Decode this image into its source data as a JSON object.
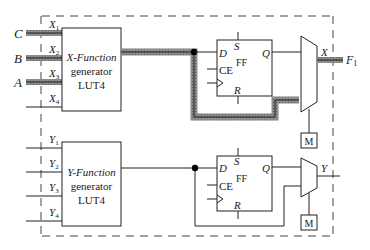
{
  "diagram": {
    "top_block": {
      "lut_label_line1": "X-Function",
      "lut_label_line2": "generator",
      "lut_label_line3": "LUT4",
      "inputs": [
        {
          "external": "C",
          "pin": "X",
          "sub": "1",
          "highlighted": true
        },
        {
          "external": "B",
          "pin": "X",
          "sub": "2",
          "highlighted": true
        },
        {
          "external": "A",
          "pin": "X",
          "sub": "3",
          "highlighted": true
        },
        {
          "external": "",
          "pin": "X",
          "sub": "4",
          "highlighted": false
        }
      ],
      "ff": {
        "d": "D",
        "s": "S",
        "q": "Q",
        "ce": "CE",
        "ff": "FF",
        "r": "R"
      },
      "mux_output_label": "X",
      "output_label": "F",
      "output_sub": "1",
      "mux_select_label": "M"
    },
    "bottom_block": {
      "lut_label_line1": "Y-Function",
      "lut_label_line2": "generator",
      "lut_label_line3": "LUT4",
      "inputs": [
        {
          "pin": "Y",
          "sub": "1"
        },
        {
          "pin": "Y",
          "sub": "2"
        },
        {
          "pin": "Y",
          "sub": "3"
        },
        {
          "pin": "Y",
          "sub": "4"
        }
      ],
      "ff": {
        "d": "D",
        "s": "S",
        "q": "Q",
        "ce": "CE",
        "ff": "FF",
        "r": "R"
      },
      "mux_output_label": "Y",
      "mux_select_label": "M"
    },
    "colors": {
      "line": "#333333",
      "highlight": "#8a8a8a",
      "dashed_border": "#444444"
    }
  }
}
